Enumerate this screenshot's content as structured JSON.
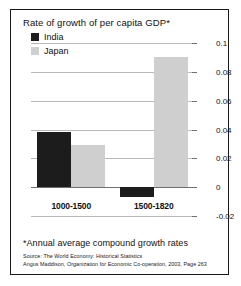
{
  "chart_data": {
    "type": "bar",
    "title": "Rate of growth of per capita GDP*",
    "xlabel": "",
    "ylabel": "",
    "categories": [
      "1000-1500",
      "1500-1820"
    ],
    "series": [
      {
        "name": "India",
        "values": [
          0.038,
          -0.007
        ],
        "color": "#1c1c1c"
      },
      {
        "name": "Japan",
        "values": [
          0.029,
          0.09
        ],
        "color": "#cfcfcf"
      }
    ],
    "ylim": [
      -0.02,
      0.1
    ],
    "yticks": [
      "0.1",
      "0.08",
      "0.06",
      "0.04",
      "0.02",
      "0",
      "-0.02"
    ],
    "ytick_values": [
      0.1,
      0.08,
      0.06,
      0.04,
      0.02,
      0,
      -0.02
    ],
    "grid": true,
    "legend_position": "inside-top-left",
    "annotations": [
      "*Annual average compound growth rates",
      "Source: The World Economy: Historical Statistics",
      "Angus Maddison, Organization for Economic Co-operation, 2003, Page 263"
    ]
  },
  "legend": {
    "entries": [
      {
        "label": "India"
      },
      {
        "label": "Japan"
      }
    ]
  },
  "footnote": {
    "note": "*Annual average compound growth rates",
    "source_line1": "Source: The World Economy: Historical Statistics",
    "source_line2": "Angus Maddison, Organization for Economic Co-operation, 2003, Page 263"
  }
}
